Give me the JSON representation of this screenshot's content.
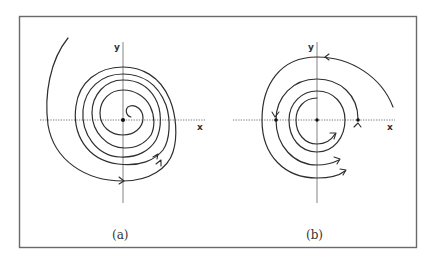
{
  "figure": {
    "frame": {
      "x": 19,
      "y": 16,
      "width": 398,
      "height": 232,
      "stroke": "#6a6a6a"
    },
    "panels": [
      {
        "id": "a",
        "caption": "(a)",
        "x_axis_label": "x",
        "y_axis_label": "y",
        "description": "Stable spiral: trajectory spirals inward to the equilibrium point at the origin",
        "center": [
          123,
          120
        ],
        "equilibrium_points": 1
      },
      {
        "id": "b",
        "caption": "(b)",
        "x_axis_label": "x",
        "y_axis_label": "y",
        "description": "Stable limit cycle: trajectories inside and outside approach a closed circular orbit",
        "center": [
          317,
          120
        ],
        "equilibrium_points": 1,
        "limit_cycle_radius": 41,
        "marked_axis_points": 2
      }
    ],
    "colors": {
      "curve": "#2e2e2e",
      "axis": "#555555",
      "background": "#ffffff"
    }
  }
}
